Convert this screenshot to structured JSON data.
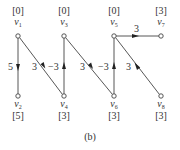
{
  "caption": "(b)",
  "colors": {
    "line": "#444444",
    "node_fill": "#ffffff",
    "text": "#333333"
  },
  "nodes": [
    {
      "id": "v1",
      "name": "v",
      "sub": "1",
      "value": "[0]",
      "x": 18,
      "y": 36,
      "label_pos": "top"
    },
    {
      "id": "v3",
      "name": "v",
      "sub": "3",
      "value": "[0]",
      "x": 64,
      "y": 36,
      "label_pos": "top"
    },
    {
      "id": "v5",
      "name": "v",
      "sub": "5",
      "value": "[0]",
      "x": 114,
      "y": 36,
      "label_pos": "top"
    },
    {
      "id": "v7",
      "name": "v",
      "sub": "7",
      "value": "[3]",
      "x": 161,
      "y": 36,
      "label_pos": "top"
    },
    {
      "id": "v2",
      "name": "v",
      "sub": "2",
      "value": "[5]",
      "x": 18,
      "y": 96,
      "label_pos": "bottom"
    },
    {
      "id": "v4",
      "name": "v",
      "sub": "4",
      "value": "[3]",
      "x": 64,
      "y": 96,
      "label_pos": "bottom"
    },
    {
      "id": "v6",
      "name": "v",
      "sub": "6",
      "value": "[3]",
      "x": 114,
      "y": 96,
      "label_pos": "bottom"
    },
    {
      "id": "v8",
      "name": "v",
      "sub": "8",
      "value": "[3]",
      "x": 161,
      "y": 96,
      "label_pos": "bottom"
    }
  ],
  "edges": [
    {
      "from": "v1",
      "to": "v2",
      "weight": "5",
      "arrow_dir": "down"
    },
    {
      "from": "v1",
      "to": "v4",
      "weight": "3",
      "arrow_dir": "down"
    },
    {
      "from": "v4",
      "to": "v3",
      "weight": "-3",
      "arrow_dir": "up"
    },
    {
      "from": "v3",
      "to": "v6",
      "weight": "3",
      "arrow_dir": "down"
    },
    {
      "from": "v6",
      "to": "v5",
      "weight": "-3",
      "arrow_dir": "up"
    },
    {
      "from": "v5",
      "to": "v7",
      "weight": "3",
      "arrow_dir": "right"
    },
    {
      "from": "v8",
      "to": "v5",
      "weight": "3",
      "arrow_dir": "up"
    }
  ],
  "labels": {
    "v1_value": "[0]",
    "v3_value": "[0]",
    "v5_value": "[0]",
    "v7_value": "[3]",
    "v2_value": "[5]",
    "v4_value": "[3]",
    "v6_value": "[3]",
    "v8_value": "[3]",
    "v_letter": "v",
    "sub1": "1",
    "sub2": "2",
    "sub3": "3",
    "sub4": "4",
    "sub5": "5",
    "sub6": "6",
    "sub7": "7",
    "sub8": "8",
    "w_v1v2": "5",
    "w_v1v4": "3",
    "w_v4v3": "−3",
    "w_v3v6": "3",
    "w_v6v5": "−3",
    "w_v5v7": "3",
    "w_v8v5": "3"
  }
}
